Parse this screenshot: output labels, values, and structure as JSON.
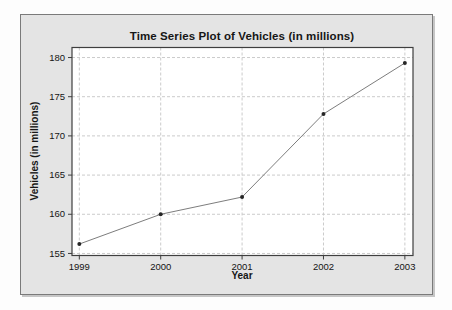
{
  "panel": {
    "bg": "#e4e4e4",
    "border": "#7a7a7a"
  },
  "chart_data": {
    "type": "line",
    "title": "Time Series Plot of Vehicles (in millions)",
    "xlabel": "Year",
    "ylabel": "Vehicles (in millions)",
    "x": [
      1999,
      2000,
      2001,
      2002,
      2003
    ],
    "values": [
      156.2,
      160.0,
      162.2,
      172.8,
      179.3
    ],
    "xticks": [
      "1999",
      "2000",
      "2001",
      "2002",
      "2003"
    ],
    "yticks": [
      "155",
      "160",
      "165",
      "170",
      "175",
      "180"
    ],
    "ytick_values": [
      155,
      160,
      165,
      170,
      175,
      180
    ],
    "xtick_values": [
      1999,
      2000,
      2001,
      2002,
      2003
    ],
    "xlim": [
      1998.91,
      2003.1
    ],
    "ylim": [
      154.74,
      181.28
    ],
    "grid": true,
    "legend": "none",
    "plot_bg": "#ffffff",
    "grid_color": "#cbcbcb",
    "axis_color": "#3f3f3f",
    "line_color": "#7d7d7d",
    "marker_color": "#262626",
    "text_color": "#141414"
  }
}
